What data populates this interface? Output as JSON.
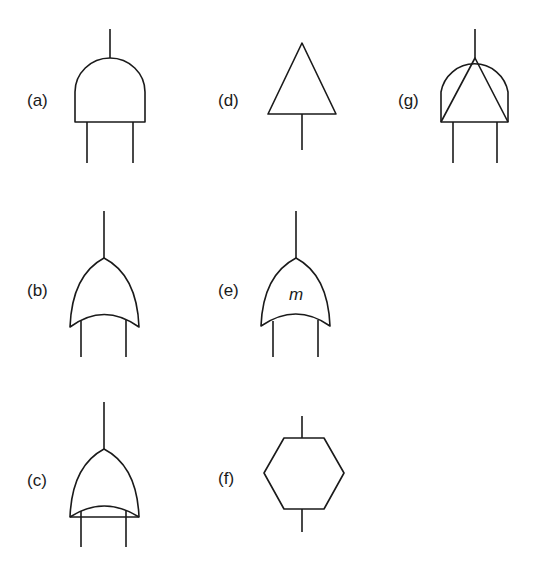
{
  "figure": {
    "colors": {
      "line": "#1a1a1a",
      "background": "#ffffff"
    },
    "symbols": [
      {
        "id": "a",
        "label": "(a)",
        "shape": "AND gate (dome, two inputs, one output)"
      },
      {
        "id": "b",
        "label": "(b)",
        "shape": "OR gate (curved, two inputs, one output)"
      },
      {
        "id": "c",
        "label": "(c)",
        "shape": "OR gate with straight base line (two inputs, one output)"
      },
      {
        "id": "d",
        "label": "(d)",
        "shape": "Triangle (one input, one output)"
      },
      {
        "id": "e",
        "label": "(e)",
        "shape": "OR gate with inner label",
        "inner_text": "m"
      },
      {
        "id": "f",
        "label": "(f)",
        "shape": "Hexagon (one input, one output)"
      },
      {
        "id": "g",
        "label": "(g)",
        "shape": "AND gate with inscribed triangle"
      }
    ]
  }
}
